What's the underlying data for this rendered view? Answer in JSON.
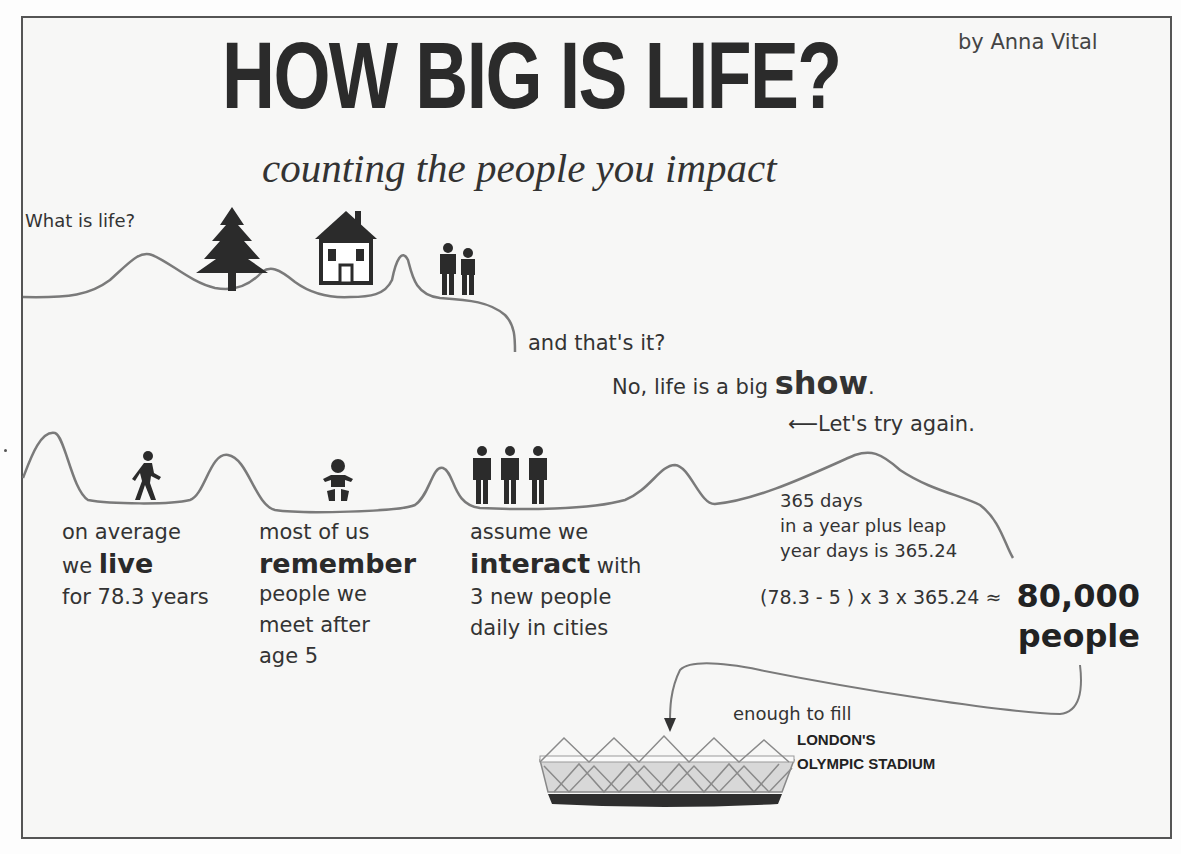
{
  "header": {
    "title": "HOW BIG IS LIFE?",
    "byline": "by Anna Vital",
    "subtitle": "counting the people you impact"
  },
  "top_row": {
    "question": "What is life?",
    "icons": [
      "tree-icon",
      "house-icon",
      "couple-icon"
    ],
    "ending": "and that's it?"
  },
  "middle": {
    "answer_prefix": "No, life is a big ",
    "answer_emphasis": "show",
    "answer_suffix": ".",
    "try_again_arrow": "⟵",
    "try_again": "Let's try again."
  },
  "steps": [
    {
      "icon": "walking-person-icon",
      "line1": "on average",
      "line2_prefix": "we ",
      "emphasis": "live",
      "line3": "for  78.3 years"
    },
    {
      "icon": "baby-icon",
      "line1": "most of us",
      "emphasis": "remember",
      "line3": "people we",
      "line4": "meet after",
      "line5": "age 5"
    },
    {
      "icon": "three-people-icon",
      "line1": "assume we",
      "emphasis": "interact",
      "emphasis_suffix": " with",
      "line3": "3 new people",
      "line4": "daily in cities"
    }
  ],
  "calc": {
    "line1": "365 days",
    "line2": "in a year plus leap",
    "line3": "year days is 365.24",
    "formula": "(78.3 - 5 ) x 3 x 365.24 ≈",
    "result_number": "80,000",
    "result_unit": "people"
  },
  "stadium": {
    "lead": "enough to fill",
    "name_line1": "LONDON'S",
    "name_line2": "OLYMPIC STADIUM",
    "icon": "stadium-icon"
  },
  "colors": {
    "text": "#2a2a2a",
    "line": "#7a7a7a",
    "border": "#555555",
    "background": "#f7f7f6"
  }
}
